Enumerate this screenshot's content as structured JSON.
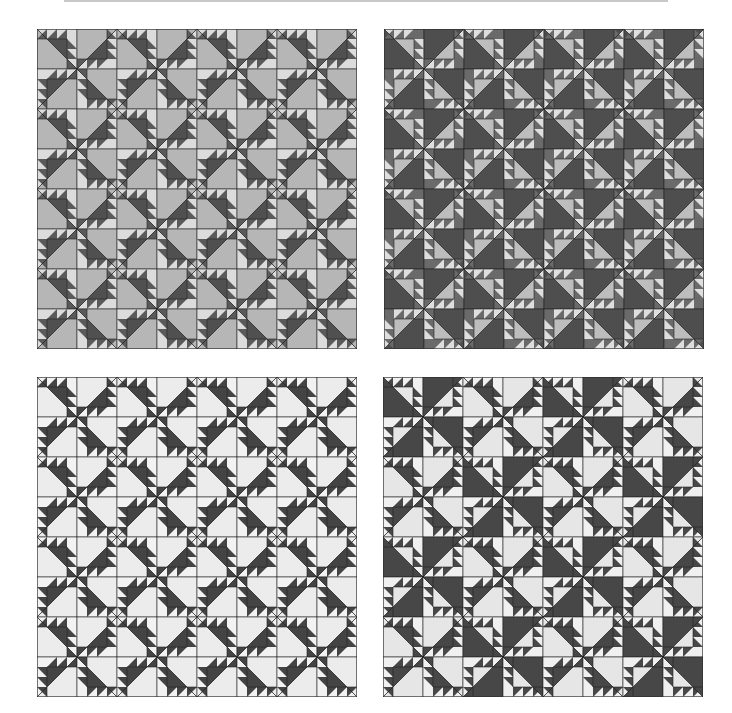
{
  "figure": {
    "grid": {
      "rows": 8,
      "cols": 8,
      "block_px": 40
    },
    "rotation_tile": [
      [
        0,
        90
      ],
      [
        270,
        180
      ]
    ],
    "quilts": [
      {
        "id": "q1",
        "left": 37,
        "top": 29,
        "colors": {
          "big": "#b6b6b6",
          "mid": "#505050",
          "saw_dark": "#5a5a5a",
          "saw_light": "#dcdcdc",
          "corner": "#dcdcdc",
          "line": "#222222"
        },
        "variant_tile": null
      },
      {
        "id": "q2",
        "left": 384,
        "top": 29,
        "colors": {
          "big": "#4e4e4e",
          "mid": "#bdbdbd",
          "saw_dark": "#6a6a6a",
          "saw_light": "#dedede",
          "corner": "#6a6a6a",
          "line": "#222222"
        },
        "variant_tile": null
      },
      {
        "id": "q3",
        "left": 37,
        "top": 377,
        "colors": {
          "big": "#ececec",
          "mid": "#444444",
          "saw_dark": "#444444",
          "saw_light": "#f2f2f2",
          "corner": "#f2f2f2",
          "line": "#222222"
        },
        "variant_tile": null
      },
      {
        "id": "q4",
        "left": 383,
        "top": 377,
        "colors": {
          "big": "#474747",
          "mid": "#e6e6e6",
          "saw_dark": "#474747",
          "saw_light": "#f0f0f0",
          "corner": "#f0f0f0",
          "line": "#222222"
        },
        "colors_alt": {
          "big": "#e6e6e6",
          "mid": "#474747",
          "saw_dark": "#474747",
          "saw_light": "#f0f0f0",
          "corner": "#f0f0f0",
          "line": "#222222"
        },
        "variant_tile": [
          [
            "D",
            "D",
            "L",
            "L"
          ],
          [
            "D",
            "D",
            "L",
            "L"
          ],
          [
            "L",
            "L",
            "D",
            "D"
          ],
          [
            "L",
            "L",
            "D",
            "D"
          ]
        ]
      }
    ]
  }
}
